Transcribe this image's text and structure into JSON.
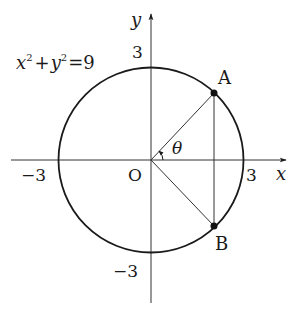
{
  "diagram": {
    "type": "unit-circle-geometry",
    "equation": {
      "x_var": "x",
      "x_exp": "2",
      "plus": "+",
      "y_var": "y",
      "y_exp": "2",
      "equals": "=9"
    },
    "axes": {
      "x_label": "x",
      "y_label": "y",
      "origin_label": "O"
    },
    "ticks": {
      "x_pos": "3",
      "x_neg": "−3",
      "y_pos": "3",
      "y_neg": "−3"
    },
    "points": {
      "A": "A",
      "B": "B"
    },
    "angle_label": "θ",
    "circle_radius": 3,
    "colors": {
      "stroke": "#1a1a1a",
      "background": "#ffffff"
    }
  }
}
